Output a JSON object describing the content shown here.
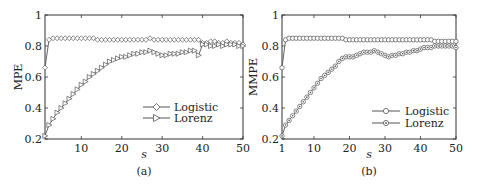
{
  "chart_data": [
    {
      "panel": "(a)",
      "type": "line",
      "xlabel": "s",
      "ylabel": "MPE",
      "caption": "(a)",
      "xlim": [
        1,
        50
      ],
      "ylim": [
        0.2,
        1
      ],
      "xticks": [
        10,
        20,
        30,
        40,
        50
      ],
      "yticks": [
        0.2,
        0.4,
        0.6,
        0.8,
        1
      ],
      "ytick_labels": [
        "0.2",
        "0.4",
        "0.6",
        "0.8",
        "1"
      ],
      "grid": false,
      "legend_position": "lower right",
      "x": [
        1,
        2,
        3,
        4,
        5,
        6,
        7,
        8,
        9,
        10,
        11,
        12,
        13,
        14,
        15,
        16,
        17,
        18,
        19,
        20,
        21,
        22,
        23,
        24,
        25,
        26,
        27,
        28,
        29,
        30,
        31,
        32,
        33,
        34,
        35,
        36,
        37,
        38,
        39,
        40,
        41,
        42,
        43,
        44,
        45,
        46,
        47,
        48,
        49,
        50
      ],
      "series": [
        {
          "name": "Logistic",
          "marker": "diamond",
          "values": [
            0.66,
            0.84,
            0.85,
            0.85,
            0.85,
            0.85,
            0.85,
            0.85,
            0.85,
            0.85,
            0.85,
            0.85,
            0.85,
            0.84,
            0.84,
            0.84,
            0.84,
            0.84,
            0.84,
            0.84,
            0.84,
            0.84,
            0.84,
            0.84,
            0.84,
            0.84,
            0.85,
            0.84,
            0.84,
            0.84,
            0.84,
            0.84,
            0.84,
            0.84,
            0.84,
            0.84,
            0.84,
            0.84,
            0.84,
            0.82,
            0.82,
            0.83,
            0.83,
            0.82,
            0.82,
            0.83,
            0.82,
            0.82,
            0.82,
            0.81
          ]
        },
        {
          "name": "Lorenz",
          "marker": "triangle-right",
          "values": [
            0.22,
            0.29,
            0.33,
            0.37,
            0.4,
            0.43,
            0.46,
            0.49,
            0.52,
            0.55,
            0.57,
            0.6,
            0.62,
            0.64,
            0.66,
            0.68,
            0.7,
            0.71,
            0.72,
            0.73,
            0.73,
            0.74,
            0.75,
            0.75,
            0.76,
            0.76,
            0.77,
            0.76,
            0.75,
            0.74,
            0.74,
            0.75,
            0.75,
            0.75,
            0.76,
            0.76,
            0.77,
            0.77,
            0.74,
            0.81,
            0.81,
            0.8,
            0.8,
            0.81,
            0.8,
            0.81,
            0.81,
            0.81,
            0.8,
            0.8
          ]
        }
      ]
    },
    {
      "panel": "(b)",
      "type": "line",
      "xlabel": "s",
      "ylabel": "MMPE",
      "caption": "(b)",
      "xlim": [
        1,
        50
      ],
      "ylim": [
        0.2,
        1
      ],
      "xticks": [
        1,
        10,
        20,
        30,
        40,
        50
      ],
      "yticks": [
        0.2,
        0.4,
        0.6,
        0.8,
        1
      ],
      "ytick_labels": [
        "0.2",
        "0.4",
        "0.6",
        "0.8",
        "1"
      ],
      "grid": false,
      "legend_position": "lower right",
      "x": [
        1,
        2,
        3,
        4,
        5,
        6,
        7,
        8,
        9,
        10,
        11,
        12,
        13,
        14,
        15,
        16,
        17,
        18,
        19,
        20,
        21,
        22,
        23,
        24,
        25,
        26,
        27,
        28,
        29,
        30,
        31,
        32,
        33,
        34,
        35,
        36,
        37,
        38,
        39,
        40,
        41,
        42,
        43,
        44,
        45,
        46,
        47,
        48,
        49,
        50
      ],
      "series": [
        {
          "name": "Logistic",
          "marker": "circle",
          "values": [
            0.66,
            0.84,
            0.85,
            0.85,
            0.85,
            0.85,
            0.85,
            0.85,
            0.85,
            0.85,
            0.85,
            0.85,
            0.85,
            0.85,
            0.85,
            0.85,
            0.85,
            0.85,
            0.84,
            0.84,
            0.84,
            0.84,
            0.84,
            0.84,
            0.84,
            0.84,
            0.84,
            0.84,
            0.84,
            0.84,
            0.84,
            0.84,
            0.84,
            0.84,
            0.84,
            0.84,
            0.84,
            0.84,
            0.84,
            0.84,
            0.84,
            0.84,
            0.84,
            0.83,
            0.83,
            0.83,
            0.83,
            0.83,
            0.83,
            0.83
          ]
        },
        {
          "name": "Lorenz",
          "marker": "circle-dot",
          "values": [
            0.22,
            0.29,
            0.32,
            0.35,
            0.38,
            0.41,
            0.44,
            0.47,
            0.5,
            0.53,
            0.56,
            0.59,
            0.61,
            0.63,
            0.65,
            0.67,
            0.7,
            0.72,
            0.73,
            0.73,
            0.73,
            0.74,
            0.75,
            0.76,
            0.76,
            0.76,
            0.77,
            0.76,
            0.75,
            0.74,
            0.73,
            0.74,
            0.74,
            0.75,
            0.75,
            0.76,
            0.76,
            0.77,
            0.77,
            0.78,
            0.79,
            0.79,
            0.79,
            0.8,
            0.8,
            0.8,
            0.8,
            0.8,
            0.8,
            0.79
          ]
        }
      ]
    }
  ],
  "panels": {
    "a": {
      "ylabel": "MPE",
      "xlabel": "s",
      "caption": "(a)",
      "legend": [
        "Logistic",
        "Lorenz"
      ]
    },
    "b": {
      "ylabel": "MMPE",
      "xlabel": "s",
      "caption": "(b)",
      "legend": [
        "Logistic",
        "Lorenz"
      ]
    }
  },
  "colors": {
    "line": "#555555",
    "axis": "#333333",
    "marker_fill": "#ffffff"
  }
}
